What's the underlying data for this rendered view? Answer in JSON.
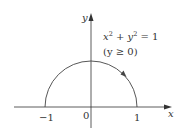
{
  "figure": {
    "axes": {
      "x_label": "x",
      "y_label": "y",
      "ticks": [
        {
          "label": "−1",
          "value": -1
        },
        {
          "label": "0",
          "value": 0
        },
        {
          "label": "1",
          "value": 1
        }
      ]
    },
    "curve": {
      "equation_lhs_x": "x",
      "equation_sup_x": "2",
      "equation_plus": " + ",
      "equation_lhs_y": "y",
      "equation_sup_y": "2",
      "equation_rhs": " = 1",
      "condition": "(y ≥ 0)",
      "description": "upper unit semicircle",
      "direction": "clockwise"
    },
    "colors": {
      "ink": "#333333",
      "background": "#ffffff"
    }
  }
}
